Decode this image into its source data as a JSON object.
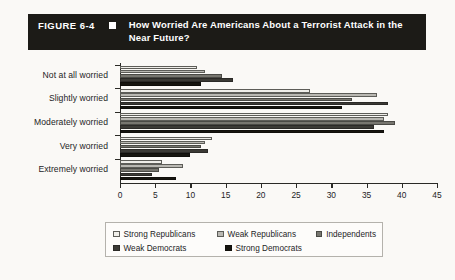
{
  "figure": {
    "label": "FIGURE 6-4",
    "marker": "black-square-bullet",
    "title": "How Worried Are Americans About a Terrorist Attack in the Near Future?"
  },
  "chart_data": {
    "type": "bar",
    "orientation": "horizontal",
    "title": "How Worried Are Americans About a Terrorist Attack in the Near Future?",
    "xlabel": "",
    "ylabel": "",
    "xlim": [
      0,
      45
    ],
    "xticks": [
      0,
      5,
      10,
      15,
      20,
      25,
      30,
      35,
      40,
      45
    ],
    "grid": false,
    "legend_position": "bottom",
    "categories": [
      "Not at all worried",
      "Slightly worried",
      "Moderately worried",
      "Very worried",
      "Extremely worried"
    ],
    "series": [
      {
        "name": "Strong Republicans",
        "color": "#efeee9",
        "values": [
          11.0,
          27.0,
          38.0,
          13.0,
          6.0
        ]
      },
      {
        "name": "Weak Republicans",
        "color": "#b9b8b2",
        "values": [
          12.0,
          36.5,
          37.5,
          12.0,
          9.0
        ]
      },
      {
        "name": "Independents",
        "color": "#77766f",
        "values": [
          14.5,
          33.0,
          39.0,
          11.5,
          5.5
        ]
      },
      {
        "name": "Weak Democrats",
        "color": "#3b3a35",
        "values": [
          16.0,
          38.0,
          36.0,
          12.5,
          4.5
        ]
      },
      {
        "name": "Strong Democrats",
        "color": "#16150f",
        "values": [
          11.5,
          31.5,
          37.5,
          10.0,
          8.0
        ]
      }
    ]
  },
  "legend": {
    "row1": [
      {
        "label": "Strong Republicans",
        "swatch": "#efeee9"
      },
      {
        "label": "Weak Republicans",
        "swatch": "#b9b8b2"
      },
      {
        "label": "Independents",
        "swatch": "#77766f"
      }
    ],
    "row2": [
      {
        "label": "Weak Democrats",
        "swatch": "#3b3a35"
      },
      {
        "label": "Strong Democrats",
        "swatch": "#16150f"
      }
    ]
  }
}
